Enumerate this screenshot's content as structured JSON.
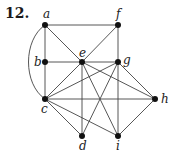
{
  "problem_number": "12.",
  "graph": {
    "vertices": [
      "a",
      "b",
      "c",
      "d",
      "e",
      "f",
      "g",
      "h",
      "i"
    ],
    "edges": [
      [
        "a",
        "f"
      ],
      [
        "a",
        "b"
      ],
      [
        "a",
        "e"
      ],
      [
        "a",
        "c",
        "curved"
      ],
      [
        "b",
        "c"
      ],
      [
        "b",
        "e"
      ],
      [
        "e",
        "g"
      ],
      [
        "f",
        "e"
      ],
      [
        "f",
        "g"
      ],
      [
        "e",
        "c"
      ],
      [
        "e",
        "d"
      ],
      [
        "e",
        "i"
      ],
      [
        "e",
        "h"
      ],
      [
        "g",
        "c"
      ],
      [
        "g",
        "d"
      ],
      [
        "g",
        "i"
      ],
      [
        "g",
        "h"
      ],
      [
        "c",
        "h"
      ],
      [
        "c",
        "d"
      ],
      [
        "c",
        "i"
      ],
      [
        "h",
        "i"
      ]
    ]
  }
}
